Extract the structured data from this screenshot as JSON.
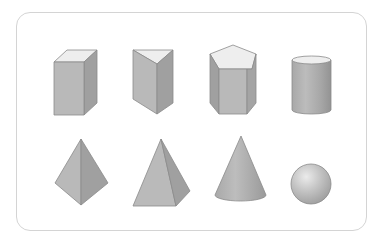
{
  "figure": {
    "shapes": [
      {
        "name": "rectangular-prism",
        "row": 1,
        "col": 1
      },
      {
        "name": "triangular-prism",
        "row": 1,
        "col": 2
      },
      {
        "name": "pentagonal-prism",
        "row": 1,
        "col": 3
      },
      {
        "name": "cylinder",
        "row": 1,
        "col": 4
      },
      {
        "name": "triangular-pyramid",
        "row": 2,
        "col": 1
      },
      {
        "name": "square-pyramid",
        "row": 2,
        "col": 2
      },
      {
        "name": "cone",
        "row": 2,
        "col": 3
      },
      {
        "name": "sphere",
        "row": 2,
        "col": 4
      }
    ],
    "colors": {
      "top_face": "#eeeeee",
      "front_face": "#b8b8b8",
      "side_face": "#9e9e9e",
      "edge": "#8a8a8a",
      "frame_border": "#d4d4d4"
    }
  }
}
